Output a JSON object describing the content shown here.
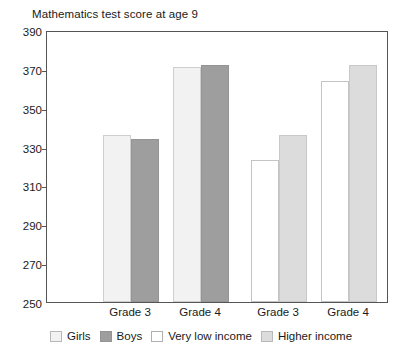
{
  "chart_data": {
    "type": "bar",
    "title": "Mathematics test score at age 9",
    "xlabel": "",
    "ylabel": "",
    "ylim": [
      250,
      390
    ],
    "ytick_step": 20,
    "yticks": [
      390,
      370,
      350,
      330,
      310,
      290,
      270,
      250
    ],
    "grid": false,
    "legend_position": "bottom",
    "categories": [
      "Grade 3",
      "Grade 4",
      "Grade 3",
      "Grade 4"
    ],
    "series": [
      {
        "name": "Girls",
        "color": "#f2f2f2",
        "values": [
          336,
          371,
          null,
          null
        ]
      },
      {
        "name": "Boys",
        "color": "#9e9e9e",
        "values": [
          334,
          372,
          null,
          null
        ]
      },
      {
        "name": "Very low income",
        "color": "#ffffff",
        "values": [
          null,
          null,
          323,
          364
        ]
      },
      {
        "name": "Higher income",
        "color": "#dcdcdc",
        "values": [
          null,
          null,
          336,
          372
        ]
      }
    ],
    "bars": [
      {
        "group": "Grade 3",
        "series": "Girls",
        "value": 336,
        "style": "girls"
      },
      {
        "group": "Grade 3",
        "series": "Boys",
        "value": 334,
        "style": "boys"
      },
      {
        "group": "Grade 4",
        "series": "Girls",
        "value": 371,
        "style": "girls"
      },
      {
        "group": "Grade 4",
        "series": "Boys",
        "value": 372,
        "style": "boys"
      },
      {
        "group": "Grade 3",
        "series": "Very low income",
        "value": 323,
        "style": "vlow"
      },
      {
        "group": "Grade 3",
        "series": "Higher income",
        "value": 336,
        "style": "high"
      },
      {
        "group": "Grade 4",
        "series": "Very low income",
        "value": 364,
        "style": "vlow"
      },
      {
        "group": "Grade 4",
        "series": "Higher income",
        "value": 372,
        "style": "high"
      }
    ],
    "legend": [
      {
        "label": "Girls",
        "style": "girls"
      },
      {
        "label": "Boys",
        "style": "boys"
      },
      {
        "label": "Very low income",
        "style": "vlow"
      },
      {
        "label": "Higher income",
        "style": "high"
      }
    ]
  }
}
